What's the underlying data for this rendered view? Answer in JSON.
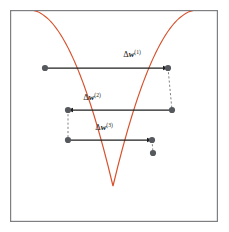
{
  "figure": {
    "background_color": "#ffffff",
    "frame": {
      "name": "plot-frame",
      "x": 10,
      "y": 10,
      "width": 208,
      "height": 212,
      "stroke_color": "#7d7f82",
      "stroke_width": 1.2,
      "fill_color": "#ffffff"
    },
    "curve": {
      "name": "error-parabola",
      "color": "#d9512c",
      "stroke_width": 1.2,
      "vertex_x": 113,
      "vertex_y": 186,
      "left_top_x": 30,
      "right_top_x": 197,
      "top_y": 10,
      "path": "M 29.5 10 Q 71 10 113 186 Q 155 10 197.5 10"
    },
    "dot_color": "#55595d",
    "dot_radius": 3.1,
    "arrow_color": "#1f1f1f",
    "arrow_width": 1.25,
    "dash_color": "#6f7275",
    "steps": [
      {
        "name": "step-1",
        "label_delta": "Δ",
        "label_var": "w",
        "label_sup": "(1)",
        "label_full": "Δw(1)",
        "label_x": 132,
        "label_y": 57,
        "arrow_y": 68,
        "from_x": 168,
        "to_x": 45,
        "direction": "right",
        "head_x": 168,
        "tail_x": 45,
        "dot_left_x": 45,
        "dot_right_x": 168
      },
      {
        "name": "step-2",
        "label_delta": "Δ",
        "label_var": "w",
        "label_sup": "(2)",
        "label_full": "Δw(2)",
        "label_x": 92,
        "label_y": 100,
        "arrow_y": 110,
        "from_x": 172,
        "to_x": 68,
        "direction": "left",
        "head_x": 68,
        "tail_x": 172,
        "dot_left_x": 68,
        "dot_right_x": 172
      },
      {
        "name": "step-3",
        "label_delta": "Δ",
        "label_var": "w",
        "label_sup": "(3)",
        "label_full": "Δw(3)",
        "label_x": 104,
        "label_y": 130,
        "arrow_y": 140,
        "from_x": 68,
        "to_x": 152,
        "direction": "right",
        "head_x": 152,
        "tail_x": 68,
        "dot_left_x": 68,
        "dot_right_x": 152
      }
    ],
    "connectors": [
      {
        "name": "connector-right-1-2",
        "x1": 168,
        "y1": 68,
        "x2": 172,
        "y2": 110
      },
      {
        "name": "connector-left-2-3",
        "x1": 68,
        "y1": 110,
        "x2": 68,
        "y2": 140
      },
      {
        "name": "connector-right-3-final",
        "x1": 152,
        "y1": 140,
        "x2": 153,
        "y2": 153
      }
    ],
    "extra_points": [
      {
        "name": "final-point",
        "x": 153,
        "y": 153
      }
    ]
  }
}
